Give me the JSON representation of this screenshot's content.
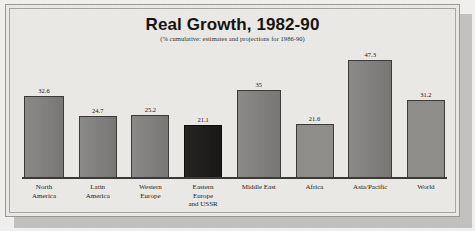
{
  "chart_data": {
    "type": "bar",
    "title": "Real Growth, 1982-90",
    "subtitle": "(% cumulative: estimates and projections  for 1986-90)",
    "xlabel": "",
    "ylabel": "",
    "ylim": [
      0,
      50
    ],
    "grid": false,
    "legend": "none",
    "categories": [
      "North America",
      "Latin America",
      "Western Europe",
      "Eastern Europe and USSR",
      "Middle East",
      "Africa",
      "Asia/Pacific",
      "World"
    ],
    "category_lines": [
      [
        "North",
        "America"
      ],
      [
        "Latin",
        "America"
      ],
      [
        "Western",
        "Europe"
      ],
      [
        "Eastern",
        "Europe",
        "and USSR"
      ],
      [
        "Middle East"
      ],
      [
        "Africa"
      ],
      [
        "Asia/Pacific"
      ],
      [
        "World"
      ]
    ],
    "values": [
      32.6,
      24.7,
      25.2,
      21.1,
      35,
      21.6,
      47.3,
      31.2
    ],
    "value_labels": [
      "32.6",
      "24.7",
      "25.2",
      "21.1",
      "35",
      "21.6",
      "47.3",
      "31.2"
    ],
    "bar_styles": [
      "normal",
      "normal",
      "normal",
      "highlight",
      "normal",
      "light",
      "normal",
      "light"
    ],
    "colors": {
      "bar_fill": "#7e7d7b",
      "bar_fill_light": "#8e8d8a",
      "bar_fill_highlight": "#1b1a18",
      "bar_outline": "#3b3a38",
      "baseline": "#393835",
      "paper": "#eceae7",
      "frame": "#9a9895",
      "shadow": "#c3c2c0",
      "text": "#15130f"
    }
  }
}
